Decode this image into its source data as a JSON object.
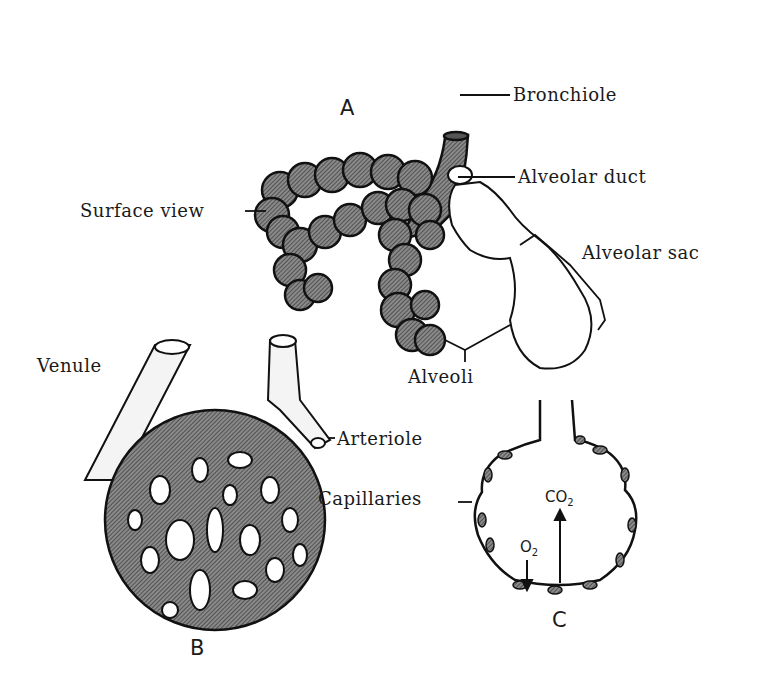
{
  "figure": {
    "panels": {
      "A": {
        "letter": "A",
        "description": "Bronchiole branching into alveolar ducts and sacs"
      },
      "B": {
        "letter": "B",
        "description": "Capillary network surrounding an alveolus"
      },
      "C": {
        "letter": "C",
        "description": "Cross-section of alveolus showing gas exchange"
      }
    },
    "labels": {
      "bronchiole": "Bronchiole",
      "alveolar_duct": "Alveolar duct",
      "surface_view": "Surface view",
      "alveolar_sac": "Alveolar sac",
      "alveoli": "Alveoli",
      "venule": "Venule",
      "arteriole": "Arteriole",
      "capillaries": "Capillaries"
    },
    "gases": {
      "co2": "CO",
      "co2_sub": "2",
      "o2": "O",
      "o2_sub": "2"
    },
    "colors": {
      "ink": "#1a1a1a",
      "fill_dark": "#6e6e6e",
      "fill_light": "#ffffff"
    }
  }
}
